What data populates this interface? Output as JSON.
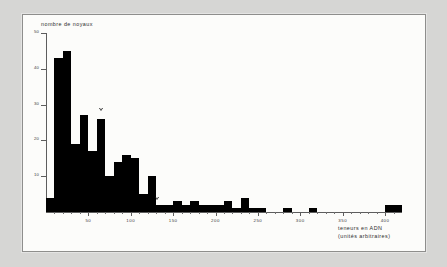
{
  "figure": {
    "background_color": "#d6d6d4",
    "plate_color": "#fcfcfa",
    "bar_color": "#000000",
    "axis_color": "#5d5d5d"
  },
  "chart_data": {
    "type": "bar",
    "title": "",
    "subtitle": "",
    "xlabel_line1": "teneurs en ADN",
    "xlabel_line2": "(unités arbitraires)",
    "ylabel": "nombre de noyaux",
    "xlim": [
      0,
      420
    ],
    "ylim": [
      0,
      50
    ],
    "grid": false,
    "legend": "none",
    "bin_width": 10,
    "x_ticks": [
      50,
      100,
      150,
      200,
      250,
      300,
      350,
      400
    ],
    "x_tick_labels": [
      "50",
      "100",
      "150",
      "200",
      "250",
      "300",
      "350",
      "400"
    ],
    "x_minor_ticks": [
      10,
      20,
      30,
      40,
      60,
      70,
      80,
      90,
      110,
      120,
      130,
      140,
      160,
      170,
      180,
      190,
      210,
      220,
      230,
      240,
      260,
      270,
      280,
      290,
      310,
      320,
      330,
      340,
      360,
      370,
      380,
      390,
      410
    ],
    "y_ticks": [
      10,
      20,
      30,
      40,
      50
    ],
    "y_tick_labels": [
      "10",
      "20",
      "30",
      "40",
      "50"
    ],
    "bin_starts": [
      0,
      10,
      20,
      30,
      40,
      50,
      60,
      70,
      80,
      90,
      100,
      110,
      120,
      130,
      140,
      150,
      160,
      170,
      180,
      190,
      200,
      210,
      220,
      230,
      240,
      250,
      260,
      270,
      280,
      290,
      300,
      310,
      320,
      330,
      340,
      350,
      360,
      370,
      380,
      390,
      400,
      410
    ],
    "values": [
      4,
      43,
      45,
      19,
      27,
      17,
      26,
      10,
      14,
      16,
      15,
      5,
      10,
      2,
      2,
      3,
      2,
      3,
      2,
      2,
      2,
      3,
      1,
      4,
      1,
      1,
      0,
      0,
      1,
      0,
      0,
      1,
      0,
      0,
      0,
      0,
      0,
      0,
      0,
      0,
      2,
      2
    ],
    "markers": [
      {
        "name": "marker-1",
        "x": 65,
        "y": 28,
        "symbol": "open-triangle-down"
      },
      {
        "name": "marker-2",
        "x": 131,
        "y": 3,
        "symbol": "open-triangle-down"
      }
    ]
  }
}
